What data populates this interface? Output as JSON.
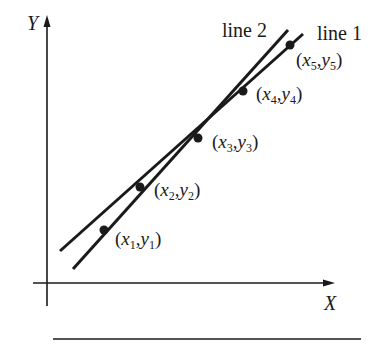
{
  "diagram": {
    "axes": {
      "y_label": "Y",
      "x_label": "X"
    },
    "lines": [
      {
        "label": "line 1",
        "from": [
          60,
          251
        ],
        "to": [
          303,
          34
        ]
      },
      {
        "label": "line 2",
        "from": [
          73,
          269
        ],
        "to": [
          288,
          30
        ]
      }
    ],
    "points": [
      {
        "x_sym": "x",
        "y_sym": "y",
        "index": "1",
        "pos": [
          104,
          230
        ]
      },
      {
        "x_sym": "x",
        "y_sym": "y",
        "index": "2",
        "pos": [
          140,
          187
        ]
      },
      {
        "x_sym": "x",
        "y_sym": "y",
        "index": "3",
        "pos": [
          198,
          138
        ]
      },
      {
        "x_sym": "x",
        "y_sym": "y",
        "index": "4",
        "pos": [
          243,
          91
        ]
      },
      {
        "x_sym": "x",
        "y_sym": "y",
        "index": "5",
        "pos": [
          290,
          45
        ]
      }
    ],
    "punct": {
      "open": "(",
      "comma": ",",
      "close": ")"
    },
    "colors": {
      "ink": "#1a1a1a",
      "background": "#ffffff"
    }
  }
}
